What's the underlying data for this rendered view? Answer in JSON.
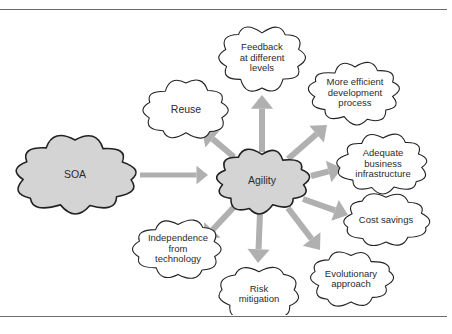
{
  "figure": {
    "title_rule_top": "",
    "title_rule_bottom": ""
  },
  "diagram": {
    "type": "cloud-concept-map",
    "source_node": {
      "id": "soa",
      "label": "SOA",
      "fill": "#d4d4d4",
      "stroke": "#222222",
      "cx": 75,
      "cy": 164,
      "rx": 63,
      "ry": 38,
      "font_size": 10.5
    },
    "hub_node": {
      "id": "agility",
      "label": "Agility",
      "fill": "#d4d4d4",
      "stroke": "#222222",
      "cx": 262,
      "cy": 170,
      "rx": 48,
      "ry": 31,
      "font_size": 10.5
    },
    "benefit_nodes": [
      {
        "id": "feedback",
        "label": "Feedback\nat different\nlevels",
        "fill": "#ffffff",
        "stroke": "#222222",
        "cx": 262,
        "cy": 47,
        "rx": 44,
        "ry": 32,
        "font_size": 9.5
      },
      {
        "id": "more-efficient-development",
        "label": "More efficient\ndevelopment\nprocess",
        "fill": "#ffffff",
        "stroke": "#222222",
        "cx": 355,
        "cy": 82,
        "rx": 47,
        "ry": 30,
        "font_size": 9.5
      },
      {
        "id": "adequate-business-infrastructure",
        "label": "Adequate\nbusiness\ninfrastructure",
        "fill": "#ffffff",
        "stroke": "#222222",
        "cx": 383,
        "cy": 153,
        "rx": 47,
        "ry": 29,
        "font_size": 9.5
      },
      {
        "id": "cost-savings",
        "label": "Cost savings",
        "fill": "#ffffff",
        "stroke": "#222222",
        "cx": 386,
        "cy": 209,
        "rx": 45,
        "ry": 26,
        "font_size": 9.5
      },
      {
        "id": "evolutionary-approach",
        "label": "Evolutionary\napproach",
        "fill": "#ffffff",
        "stroke": "#222222",
        "cx": 351,
        "cy": 268,
        "rx": 43,
        "ry": 27,
        "font_size": 9.5
      },
      {
        "id": "risk-mitigation",
        "label": "Risk\nmitigation",
        "fill": "#ffffff",
        "stroke": "#222222",
        "cx": 259,
        "cy": 283,
        "rx": 42,
        "ry": 28,
        "font_size": 9.5
      },
      {
        "id": "independence-from-technology",
        "label": "Independence\nfrom\ntechnology",
        "fill": "#ffffff",
        "stroke": "#222222",
        "cx": 178,
        "cy": 238,
        "rx": 46,
        "ry": 29,
        "font_size": 9.5
      },
      {
        "id": "reuse",
        "label": "Reuse",
        "fill": "#ffffff",
        "stroke": "#222222",
        "cx": 186,
        "cy": 99,
        "rx": 44,
        "ry": 29,
        "font_size": 10.5
      }
    ],
    "arrows": {
      "color": "#b0b0b0",
      "main": {
        "id": "soa-to-agility",
        "from": "soa",
        "to": "agility",
        "x1": 140,
        "y1": 164,
        "x2": 208,
        "y2": 164,
        "width": 5
      },
      "radial": [
        {
          "id": "agility-to-feedback",
          "to": "feedback",
          "x1": 262,
          "y1": 141,
          "x2": 262,
          "y2": 84,
          "width": 6
        },
        {
          "id": "agility-to-more-efficient-development",
          "to": "more-efficient-development",
          "x1": 288,
          "y1": 148,
          "x2": 327,
          "y2": 114,
          "width": 6
        },
        {
          "id": "agility-to-adequate-business-infrastructure",
          "to": "adequate-business-infrastructure",
          "x1": 311,
          "y1": 165,
          "x2": 342,
          "y2": 157,
          "width": 6
        },
        {
          "id": "agility-to-cost-savings",
          "to": "cost-savings",
          "x1": 303,
          "y1": 188,
          "x2": 348,
          "y2": 204,
          "width": 6
        },
        {
          "id": "agility-to-evolutionary-approach",
          "to": "evolutionary-approach",
          "x1": 288,
          "y1": 197,
          "x2": 320,
          "y2": 239,
          "width": 6
        },
        {
          "id": "agility-to-risk-mitigation",
          "to": "risk-mitigation",
          "x1": 260,
          "y1": 202,
          "x2": 258,
          "y2": 252,
          "width": 6
        },
        {
          "id": "agility-to-independence-from-technology",
          "to": "independence-from-technology",
          "x1": 234,
          "y1": 196,
          "x2": 203,
          "y2": 229,
          "width": 6
        },
        {
          "id": "agility-to-reuse",
          "to": "reuse",
          "x1": 234,
          "y1": 146,
          "x2": 202,
          "y2": 119,
          "width": 6
        }
      ]
    }
  }
}
